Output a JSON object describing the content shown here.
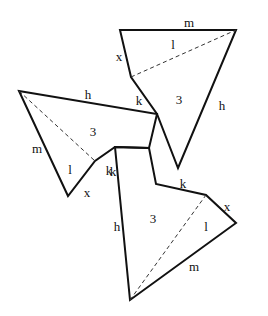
{
  "diagram": {
    "stroke_color": "#111111",
    "pieces": [
      {
        "id": "top",
        "outline": [
          [
            120,
            30
          ],
          [
            236,
            30
          ],
          [
            178,
            168
          ],
          [
            157,
            114
          ],
          [
            131,
            77
          ]
        ],
        "diagonal": [
          [
            131,
            77
          ],
          [
            236,
            30
          ]
        ],
        "labels": [
          {
            "text": "m",
            "x": 189,
            "y": 22
          },
          {
            "text": "x",
            "x": 119,
            "y": 56
          },
          {
            "text": "l",
            "x": 173,
            "y": 44
          },
          {
            "text": "k",
            "x": 139,
            "y": 100
          },
          {
            "text": "3",
            "x": 179,
            "y": 99
          },
          {
            "text": "h",
            "x": 222,
            "y": 105
          }
        ]
      },
      {
        "id": "left",
        "outline": [
          [
            19,
            91
          ],
          [
            157,
            114
          ],
          [
            149,
            148
          ],
          [
            115,
            147
          ],
          [
            95,
            161
          ],
          [
            68,
            196
          ]
        ],
        "diagonal": [
          [
            19,
            91
          ],
          [
            95,
            161
          ]
        ],
        "labels": [
          {
            "text": "h",
            "x": 88,
            "y": 94
          },
          {
            "text": "3",
            "x": 93,
            "y": 131
          },
          {
            "text": "m",
            "x": 37,
            "y": 148
          },
          {
            "text": "l",
            "x": 70,
            "y": 169
          },
          {
            "text": "k",
            "x": 109,
            "y": 170
          },
          {
            "text": "x",
            "x": 87,
            "y": 192
          }
        ]
      },
      {
        "id": "bottom",
        "outline": [
          [
            115,
            147
          ],
          [
            149,
            148
          ],
          [
            156,
            184
          ],
          [
            206,
            195
          ],
          [
            236,
            223
          ],
          [
            130,
            300
          ]
        ],
        "diagonal": [
          [
            130,
            300
          ],
          [
            206,
            195
          ]
        ],
        "labels": [
          {
            "text": "k",
            "x": 113,
            "y": 171
          },
          {
            "text": "k",
            "x": 183,
            "y": 183
          },
          {
            "text": "x",
            "x": 227,
            "y": 206
          },
          {
            "text": "h",
            "x": 117,
            "y": 226
          },
          {
            "text": "3",
            "x": 153,
            "y": 218
          },
          {
            "text": "l",
            "x": 206,
            "y": 226
          },
          {
            "text": "m",
            "x": 194,
            "y": 266
          }
        ]
      }
    ]
  }
}
